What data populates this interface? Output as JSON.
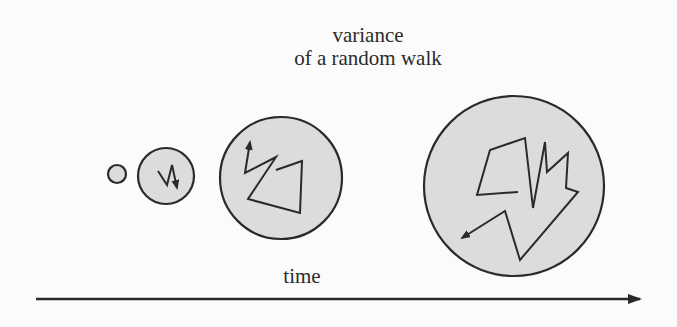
{
  "figure": {
    "title_line1": "variance",
    "title_line2": "of a random walk",
    "axis_label": "time",
    "colors": {
      "background": "#fbfbfb",
      "circle_fill": "#dcdcdc",
      "stroke": "#2a2a2a",
      "text": "#2b2b2b"
    },
    "circles": [
      {
        "id": "t1",
        "cx": 117,
        "cy": 174,
        "r": 9
      },
      {
        "id": "t2",
        "cx": 166,
        "cy": 176,
        "r": 28
      },
      {
        "id": "t3",
        "cx": 281,
        "cy": 178,
        "r": 61
      },
      {
        "id": "t4",
        "cx": 514,
        "cy": 186,
        "r": 90
      }
    ],
    "walks": [
      {
        "circle": "t2",
        "points": "158,171 167,185 172,165 177,188"
      },
      {
        "circle": "t3",
        "points": "276,170 302,161 300,213 248,199 276,157 245,173 250,142"
      },
      {
        "circle": "t4",
        "points": "518,192 477,195 490,150 525,138 533,208 545,142 547,172 568,153 566,188 578,192 520,260 505,211 462,238"
      }
    ],
    "time_axis": {
      "x1": 36,
      "y1": 299,
      "x2": 640,
      "y2": 299
    }
  }
}
